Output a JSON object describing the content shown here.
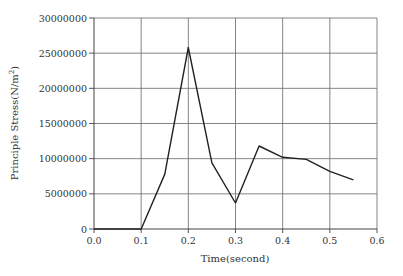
{
  "chart_data": {
    "type": "line",
    "title": "",
    "xlabel": "Time(second)",
    "ylabel": "Principle Stress(N/m²)",
    "xlim": [
      0.0,
      0.6
    ],
    "ylim": [
      0,
      30000000
    ],
    "grid": true,
    "legend": null,
    "x_ticks": [
      "0.0",
      "0.1",
      "0.2",
      "0.3",
      "0.4",
      "0.5",
      "0.6"
    ],
    "y_ticks": [
      "0",
      "5000000",
      "10000000",
      "15000000",
      "20000000",
      "25000000",
      "30000000"
    ],
    "series": [
      {
        "name": "Principle Stress",
        "x": [
          0.0,
          0.05,
          0.1,
          0.15,
          0.2,
          0.25,
          0.3,
          0.35,
          0.4,
          0.45,
          0.5,
          0.55
        ],
        "values": [
          0,
          0,
          0,
          7800000,
          25800000,
          9400000,
          3700000,
          11800000,
          10200000,
          9900000,
          8200000,
          7000000
        ]
      }
    ]
  },
  "axes": {
    "x_title": "Time(second)",
    "y_title": "Principle Stress(N/m",
    "y_title_sup": "2",
    "y_title_end": ")"
  },
  "colors": {
    "line": "#222222",
    "grid": "#777777",
    "axis": "#444444"
  }
}
